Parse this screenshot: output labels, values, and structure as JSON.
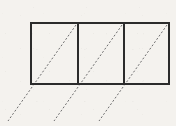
{
  "figure": {
    "background_color": "#f4f2ee",
    "solid_stroke_color": "#2b2b2b",
    "dashed_stroke_color": "#6e6e6e",
    "solid_stroke_width": 2,
    "dashed_stroke_width": 1,
    "dash_pattern": "2 2"
  },
  "chart_data": {
    "type": "diagram",
    "xlabel": "",
    "ylabel": "",
    "grid": false,
    "legend": "none",
    "view_box": {
      "x": 0,
      "y": 0,
      "width": 176,
      "height": 126
    },
    "rectangle": {
      "name": "outer-rectangle",
      "x": 31,
      "y": 23,
      "width": 138,
      "height": 61,
      "left": 31,
      "right": 169,
      "top": 23,
      "bottom": 84,
      "fill": "none",
      "stroke": "#2b2b2b",
      "stroke_width": 2
    },
    "dividers": [
      {
        "name": "divider-1",
        "x1": 78,
        "y1": 23,
        "x2": 78,
        "y2": 84,
        "stroke": "#2b2b2b",
        "stroke_width": 2
      },
      {
        "name": "divider-2",
        "x1": 124,
        "y1": 23,
        "x2": 124,
        "y2": 84,
        "stroke": "#2b2b2b",
        "stroke_width": 2
      }
    ],
    "cells": [
      {
        "name": "cell-left",
        "x": 31,
        "y": 23,
        "width": 47,
        "height": 61
      },
      {
        "name": "cell-middle",
        "x": 78,
        "y": 23,
        "width": 46,
        "height": 61
      },
      {
        "name": "cell-right",
        "x": 124,
        "y": 23,
        "width": 45,
        "height": 61
      }
    ],
    "dashed_diagonals": [
      {
        "name": "diagonal-1",
        "x1": 76,
        "y1": 25,
        "x2": 8,
        "y2": 121,
        "slope_deg": 54.7,
        "style": "dashed",
        "stroke": "#6e6e6e",
        "stroke_width": 1
      },
      {
        "name": "diagonal-2",
        "x1": 122,
        "y1": 25,
        "x2": 54,
        "y2": 121,
        "slope_deg": 54.7,
        "style": "dashed",
        "stroke": "#6e6e6e",
        "stroke_width": 1
      },
      {
        "name": "diagonal-3",
        "x1": 167,
        "y1": 25,
        "x2": 99,
        "y2": 121,
        "slope_deg": 54.7,
        "style": "dashed",
        "stroke": "#6e6e6e",
        "stroke_width": 1
      }
    ],
    "annotations": [],
    "tick_labels": []
  }
}
